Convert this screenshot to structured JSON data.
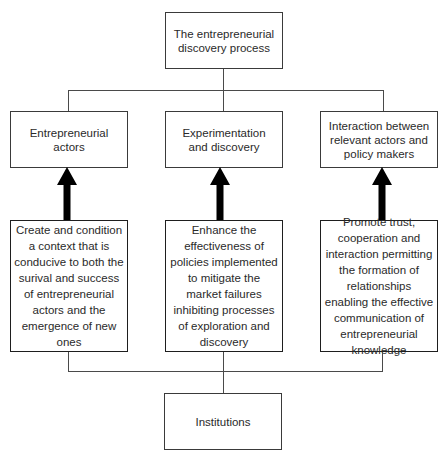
{
  "diagram": {
    "top": {
      "label": "The entrepreneurial discovery process"
    },
    "middle_row": [
      {
        "label": "Entrepreneurial actors"
      },
      {
        "label": "Experimentation and discovery"
      },
      {
        "label": "Interaction between relevant actors and policy makers"
      }
    ],
    "lower_row": [
      {
        "label": "Create and condition a context that is conducive to both the surival and success of entrepreneurial actors and the emergence of new ones"
      },
      {
        "label": "Enhance the effectiveness of policies implemented to mitigate the market failures inhibiting processes of exploration and discovery"
      },
      {
        "label": "Promote trust, cooperation and interaction permitting the formation of relationships enabling the effective communication of entrepreneurial knowledge"
      }
    ],
    "bottom": {
      "label": "Institutions"
    },
    "colors": {
      "line": "#4a4a4a",
      "arrow": "#000000",
      "text": "#2a2a2a",
      "background": "#ffffff"
    }
  }
}
